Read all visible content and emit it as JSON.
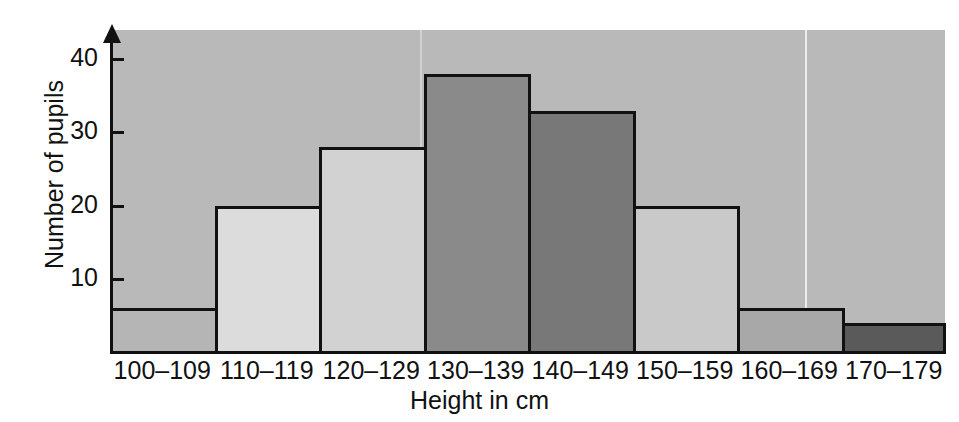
{
  "chart_data": {
    "type": "bar",
    "title": "",
    "subtitle": "",
    "xlabel": "Height in cm",
    "ylabel": "Number of pupils",
    "categories": [
      "100–109",
      "110–119",
      "120–129",
      "130–139",
      "140–149",
      "150–159",
      "160–169",
      "170–179"
    ],
    "values": [
      6,
      20,
      28,
      38,
      33,
      20,
      6,
      4
    ],
    "bar_fills": [
      "#b5b5b5",
      "#dcdcdc",
      "#d2d2d2",
      "#8a8a8a",
      "#787878",
      "#c9c9c9",
      "#a8a8a8",
      "#5a5a5a"
    ],
    "ylim": [
      0,
      44
    ],
    "yticks": [
      10,
      20,
      30,
      40
    ],
    "ytick_labels": [
      "10",
      "20",
      "30",
      "40"
    ],
    "grid": false,
    "legend": null,
    "annotations": [],
    "colors": {
      "plot_background": "#b9b9b9",
      "page_background": "#ffffff",
      "axis": "#111111",
      "bar_outline": "#111111",
      "text": "#111111"
    }
  }
}
